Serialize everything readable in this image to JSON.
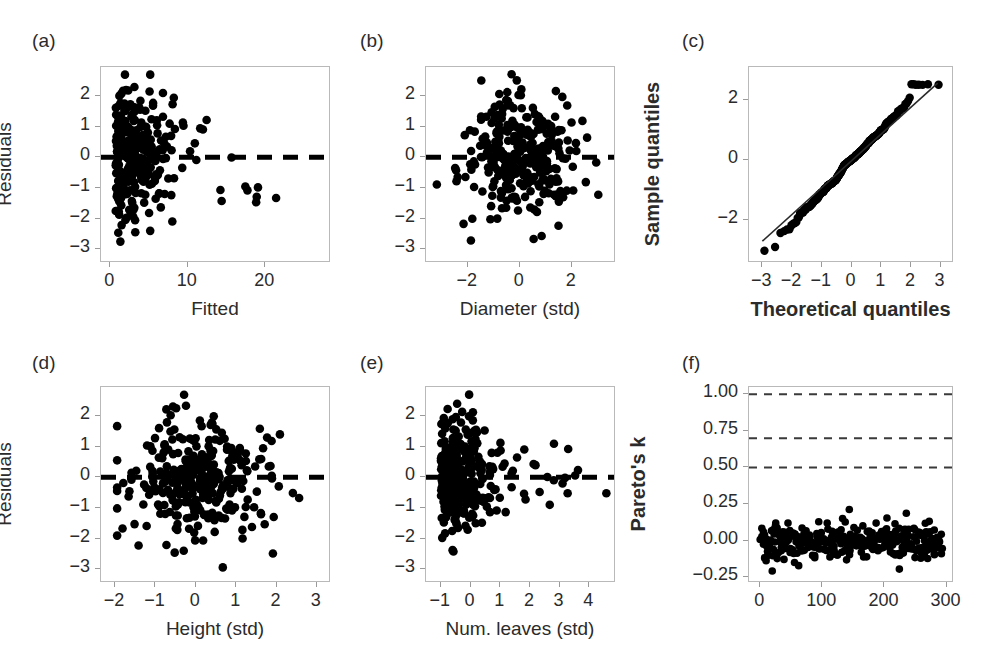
{
  "figure": {
    "panels": [
      {
        "id": "a",
        "label": "(a)",
        "xlabel": "Fitted",
        "ylabel": "Residuals",
        "ylabel_bold": false,
        "xlabel_bold": false,
        "xticks": [
          0,
          10,
          20
        ],
        "yticks": [
          2,
          1,
          0,
          -1,
          -2,
          -3
        ],
        "xlim": [
          -1.2,
          28.5
        ],
        "ylim": [
          -3.45,
          2.95
        ],
        "hline": 0,
        "hline_style": "dashed-thick"
      },
      {
        "id": "b",
        "label": "(b)",
        "xlabel": "Diameter (std)",
        "ylabel": "",
        "ylabel_bold": false,
        "xlabel_bold": false,
        "xticks": [
          -2,
          0,
          2
        ],
        "yticks": [
          2,
          1,
          0,
          -1,
          -2,
          -3
        ],
        "xlim": [
          -3.6,
          3.7
        ],
        "ylim": [
          -3.45,
          2.95
        ],
        "hline": 0,
        "hline_style": "dashed-thick"
      },
      {
        "id": "c",
        "label": "(c)",
        "xlabel": "Theoretical quantiles",
        "ylabel": "Sample quantiles",
        "ylabel_bold": true,
        "xlabel_bold": true,
        "xticks": [
          -3,
          -2,
          -1,
          0,
          1,
          2,
          3
        ],
        "yticks": [
          2,
          0,
          -2
        ],
        "xlim": [
          -3.45,
          3.45
        ],
        "ylim": [
          -3.45,
          3.1
        ],
        "refline": true
      },
      {
        "id": "d",
        "label": "(d)",
        "xlabel": "Height (std)",
        "ylabel": "Residuals",
        "ylabel_bold": false,
        "xlabel_bold": false,
        "xticks": [
          -2,
          -1,
          0,
          1,
          2,
          3
        ],
        "yticks": [
          2,
          1,
          0,
          -1,
          -2,
          -3
        ],
        "xlim": [
          -2.35,
          3.35
        ],
        "ylim": [
          -3.45,
          2.95
        ],
        "hline": 0,
        "hline_style": "dashed-thick"
      },
      {
        "id": "e",
        "label": "(e)",
        "xlabel": "Num. leaves (std)",
        "ylabel": "",
        "ylabel_bold": false,
        "xlabel_bold": false,
        "xticks": [
          -1,
          0,
          1,
          2,
          3,
          4
        ],
        "yticks": [
          2,
          1,
          0,
          -1,
          -2,
          -3
        ],
        "xlim": [
          -1.5,
          4.9
        ],
        "ylim": [
          -3.45,
          2.95
        ],
        "hline": 0,
        "hline_style": "dashed-thick"
      },
      {
        "id": "f",
        "label": "(f)",
        "xlabel": "",
        "ylabel": "Pareto's k",
        "ylabel_bold": true,
        "xlabel_bold": false,
        "xticks": [
          0,
          100,
          200,
          300
        ],
        "yticks": [
          "1.00",
          "0.75",
          "0.50",
          "0.25",
          "0.00",
          "-0.25"
        ],
        "ytickvals": [
          1.0,
          0.75,
          0.5,
          0.25,
          0.0,
          -0.25
        ],
        "xlim": [
          -18,
          312
        ],
        "ylim": [
          -0.29,
          1.05
        ],
        "threshold_lines": [
          0.5,
          0.7,
          1.0
        ],
        "threshold_style": "dashed-thin"
      }
    ]
  },
  "chart_data": [
    {
      "type": "scatter",
      "panel": "a",
      "title": "(a)",
      "xlabel": "Fitted",
      "ylabel": "Residuals",
      "xlim": [
        -1.2,
        28.5
      ],
      "ylim": [
        -3.45,
        2.95
      ],
      "xticks": [
        0,
        10,
        20
      ],
      "yticks": [
        -3,
        -2,
        -1,
        0,
        1,
        2
      ],
      "grid": false,
      "annotations": [
        "dashed horizontal reference line at y = 0"
      ],
      "n_points": 300,
      "marker_color": "#000000"
    },
    {
      "type": "scatter",
      "panel": "b",
      "title": "(b)",
      "xlabel": "Diameter (std)",
      "ylabel": "Residuals",
      "xlim": [
        -3.6,
        3.7
      ],
      "ylim": [
        -3.45,
        2.95
      ],
      "xticks": [
        -2,
        0,
        2
      ],
      "yticks": [
        -3,
        -2,
        -1,
        0,
        1,
        2
      ],
      "grid": false,
      "annotations": [
        "dashed horizontal reference line at y = 0"
      ],
      "n_points": 300,
      "marker_color": "#000000"
    },
    {
      "type": "scatter",
      "panel": "c",
      "title": "(c)",
      "xlabel": "Theoretical quantiles",
      "ylabel": "Sample quantiles",
      "xlim": [
        -3.45,
        3.45
      ],
      "ylim": [
        -3.45,
        3.1
      ],
      "xticks": [
        -3,
        -2,
        -1,
        0,
        1,
        2,
        3
      ],
      "yticks": [
        -2,
        0,
        2
      ],
      "grid": false,
      "annotations": [
        "normal Q-Q reference line through quantiles"
      ],
      "n_points": 300,
      "marker_color": "#000000"
    },
    {
      "type": "scatter",
      "panel": "d",
      "title": "(d)",
      "xlabel": "Height (std)",
      "ylabel": "Residuals",
      "xlim": [
        -2.35,
        3.35
      ],
      "ylim": [
        -3.45,
        2.95
      ],
      "xticks": [
        -2,
        -1,
        0,
        1,
        2,
        3
      ],
      "yticks": [
        -3,
        -2,
        -1,
        0,
        1,
        2
      ],
      "grid": false,
      "annotations": [
        "dashed horizontal reference line at y = 0"
      ],
      "n_points": 300,
      "marker_color": "#000000"
    },
    {
      "type": "scatter",
      "panel": "e",
      "title": "(e)",
      "xlabel": "Num. leaves (std)",
      "ylabel": "Residuals",
      "xlim": [
        -1.5,
        4.9
      ],
      "ylim": [
        -3.45,
        2.95
      ],
      "xticks": [
        -1,
        0,
        1,
        2,
        3,
        4
      ],
      "yticks": [
        -3,
        -2,
        -1,
        0,
        1,
        2
      ],
      "grid": false,
      "annotations": [
        "dashed horizontal reference line at y = 0"
      ],
      "n_points": 300,
      "marker_color": "#000000"
    },
    {
      "type": "scatter",
      "panel": "f",
      "title": "(f)",
      "xlabel": "",
      "ylabel": "Pareto's k",
      "xlim": [
        -18,
        312
      ],
      "ylim": [
        -0.29,
        1.05
      ],
      "xticks": [
        0,
        100,
        200,
        300
      ],
      "yticks": [
        -0.25,
        0.0,
        0.25,
        0.5,
        0.75,
        1.0
      ],
      "grid": false,
      "annotations": [
        "dashed threshold line at k = 0.50",
        "dashed threshold line at k = 0.70",
        "dashed threshold line at k = 1.00"
      ],
      "n_points": 300,
      "marker_color": "#000000"
    }
  ]
}
